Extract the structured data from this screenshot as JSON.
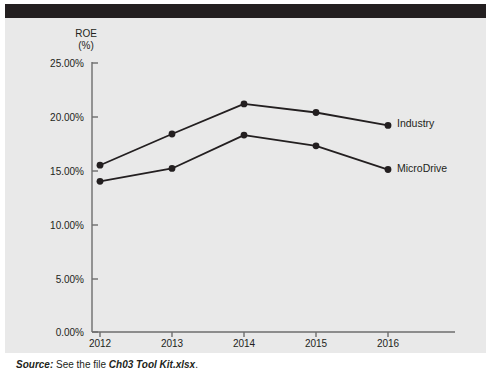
{
  "figure": {
    "header_band_color": "#231f20",
    "panel_color": "#e9e9e9",
    "top_remnant_text": "",
    "source": {
      "label": "Source:",
      "text_before": " See the file ",
      "file": "Ch03 Tool Kit.xlsx",
      "text_after": "."
    }
  },
  "chart_data": {
    "type": "line",
    "title": "",
    "xlabel": "",
    "ylabel": "ROE",
    "ylabel_unit": "(%)",
    "categories": [
      "2012",
      "2013",
      "2014",
      "2015",
      "2016"
    ],
    "x": [
      2012,
      2013,
      2014,
      2015,
      2016
    ],
    "ylim": [
      0,
      25
    ],
    "ytick_labels": [
      "0.00%",
      "5.00%",
      "10.00%",
      "15.00%",
      "20.00%",
      "25.00%"
    ],
    "ytick_values": [
      0,
      5,
      10,
      15,
      20,
      25
    ],
    "grid": false,
    "legend_position": "inline-right",
    "marker": "filled-circle",
    "line_color": "#231f20",
    "series": [
      {
        "name": "Industry",
        "values": [
          15.5,
          18.4,
          21.2,
          20.4,
          19.2
        ]
      },
      {
        "name": "MicroDrive",
        "values": [
          14.0,
          15.2,
          18.3,
          17.3,
          15.1
        ]
      }
    ]
  }
}
